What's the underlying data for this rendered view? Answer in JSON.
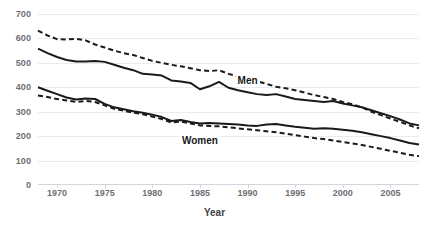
{
  "chart_data": {
    "type": "line",
    "title": "",
    "xlabel": "Year",
    "ylabel": "",
    "xlim": [
      1968,
      2008
    ],
    "ylim": [
      0,
      700
    ],
    "grid": true,
    "legend": "inline-annotations",
    "y_ticks": [
      0,
      100,
      200,
      300,
      400,
      500,
      600,
      700
    ],
    "x_ticks": [
      1970,
      1975,
      1980,
      1985,
      1990,
      1995,
      2000,
      2005
    ],
    "x": [
      1968,
      1969,
      1970,
      1971,
      1972,
      1973,
      1974,
      1975,
      1976,
      1977,
      1978,
      1979,
      1980,
      1981,
      1982,
      1983,
      1984,
      1985,
      1986,
      1987,
      1988,
      1989,
      1990,
      1991,
      1992,
      1993,
      1994,
      1995,
      1996,
      1997,
      1998,
      1999,
      2000,
      2001,
      2002,
      2003,
      2004,
      2005,
      2006,
      2007,
      2008
    ],
    "series": [
      {
        "name": "Men dashed",
        "group": "Men",
        "style": "dashed",
        "color": "#1a1a1a",
        "values": [
          632,
          612,
          597,
          596,
          598,
          592,
          575,
          563,
          550,
          540,
          532,
          520,
          508,
          500,
          492,
          486,
          478,
          470,
          466,
          470,
          455,
          444,
          434,
          424,
          414,
          402,
          396,
          388,
          378,
          368,
          360,
          352,
          340,
          330,
          318,
          300,
          286,
          272,
          258,
          244,
          232
        ]
      },
      {
        "name": "Men solid",
        "group": "Men",
        "style": "solid",
        "color": "#1a1a1a",
        "values": [
          558,
          540,
          524,
          512,
          506,
          506,
          508,
          504,
          492,
          480,
          470,
          455,
          452,
          448,
          428,
          424,
          418,
          392,
          404,
          422,
          398,
          388,
          380,
          372,
          368,
          372,
          362,
          352,
          348,
          344,
          340,
          344,
          334,
          326,
          318,
          306,
          294,
          282,
          268,
          252,
          244
        ]
      },
      {
        "name": "Women solid",
        "group": "Women",
        "style": "solid",
        "color": "#1a1a1a",
        "values": [
          400,
          386,
          372,
          358,
          350,
          354,
          352,
          332,
          318,
          310,
          302,
          296,
          288,
          278,
          262,
          266,
          258,
          252,
          254,
          252,
          250,
          248,
          244,
          242,
          248,
          250,
          244,
          238,
          234,
          230,
          232,
          230,
          226,
          222,
          216,
          208,
          200,
          192,
          182,
          172,
          166
        ]
      },
      {
        "name": "Women dashed",
        "group": "Women",
        "style": "dashed",
        "color": "#1a1a1a",
        "values": [
          366,
          360,
          352,
          346,
          340,
          344,
          340,
          326,
          312,
          304,
          296,
          290,
          280,
          270,
          256,
          260,
          252,
          244,
          242,
          240,
          236,
          232,
          228,
          224,
          220,
          216,
          210,
          204,
          198,
          192,
          188,
          182,
          176,
          170,
          164,
          156,
          148,
          140,
          132,
          124,
          118
        ]
      }
    ],
    "annotations": [
      {
        "text": "Men",
        "x": 1990,
        "y": 420
      },
      {
        "text": "Women",
        "x": 1985,
        "y": 178
      }
    ]
  },
  "axis": {
    "y_tick_labels": [
      "700",
      "600",
      "500",
      "400",
      "300",
      "200",
      "100",
      "0"
    ],
    "x_tick_labels": [
      "1970",
      "1975",
      "1980",
      "1985",
      "1990",
      "1995",
      "2000",
      "2005"
    ],
    "x_title": "Year"
  },
  "labels": {
    "men": "Men",
    "women": "Women"
  }
}
